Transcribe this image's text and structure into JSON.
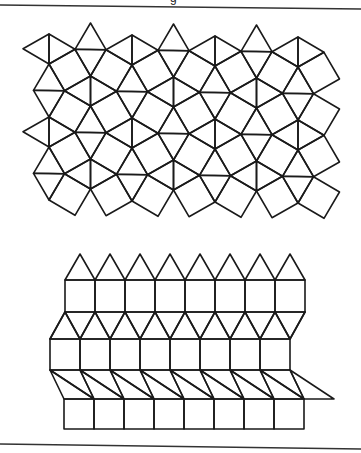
{
  "caption_fragment": "g",
  "colors": {
    "stroke": "#1a1a1a",
    "rule": "#333333",
    "background": "#ffffff"
  },
  "rules": [
    {
      "name": "top-rule",
      "x1": 0,
      "y1": 5,
      "x2": 361,
      "y2": 9
    },
    {
      "name": "bottom-rule",
      "x1": 0,
      "y1": 444,
      "x2": 361,
      "y2": 449
    }
  ],
  "snub_square_tiling": {
    "label": "snub square tiling (3.3.4.3.4)",
    "origin": [
      49,
      49
    ],
    "lattice_a": [
      41.5,
      41.5
    ],
    "lattice_b": [
      41.5,
      -41.5
    ],
    "half_edge": 15,
    "apex": 26,
    "y_skew_per_px": 0.012,
    "clip_centroid": {
      "xmin": 34,
      "xmax": 325,
      "ymin": 34,
      "ymax": 200
    }
  },
  "elongated_triangular_tiling": {
    "label": "elongated triangular tiling (3.3.3.4.4)",
    "edge": 30,
    "count": 8,
    "rows": [
      {
        "type": "triangles-up",
        "x0": 65,
        "base_y": 280,
        "apex_y": 254
      },
      {
        "type": "squares",
        "x0": 65,
        "y_top": 280,
        "y_bottom": 312
      },
      {
        "type": "zigzag",
        "x_top0": 65,
        "y_top": 312,
        "x_bot0": 50,
        "y_bot": 339
      },
      {
        "type": "squares",
        "x0": 50,
        "y_top": 339,
        "y_bottom": 370
      },
      {
        "type": "zigzag",
        "x_top0": 50,
        "y_top": 370,
        "x_bot0": 64,
        "y_bot": 399
      },
      {
        "type": "squares",
        "x0": 64,
        "y_top": 399,
        "y_bottom": 429
      }
    ]
  }
}
